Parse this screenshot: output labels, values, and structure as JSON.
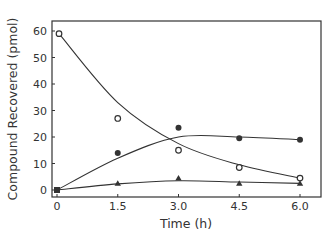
{
  "chart_data": {
    "type": "scatter",
    "title": "",
    "xlabel": "Time (h)",
    "ylabel": "Compound Recovered (pmol)",
    "x": [
      0,
      1.5,
      3.0,
      4.5,
      6.0
    ],
    "xticks": [
      "0",
      "1.5",
      "3.0",
      "4.5",
      "6.0"
    ],
    "yticks": [
      "0",
      "10",
      "20",
      "30",
      "40",
      "50",
      "60"
    ],
    "xlim": [
      -0.15,
      6.5
    ],
    "ylim": [
      -3,
      64
    ],
    "grid": false,
    "legend": null,
    "series": [
      {
        "name": "open circles",
        "marker": "open-circle",
        "values": [
          59,
          27,
          15,
          8.5,
          4.5
        ],
        "fit": "smooth decay curve"
      },
      {
        "name": "filled circles",
        "marker": "filled-circle",
        "values": [
          0,
          14,
          23.5,
          19.5,
          19
        ],
        "fit": "smooth rise then plateau curve"
      },
      {
        "name": "filled triangles",
        "marker": "filled-triangle",
        "values": [
          0,
          2.5,
          4.5,
          2.5,
          2.5
        ],
        "fit": "smooth low curve"
      }
    ]
  },
  "colors": {
    "ink": "#333333",
    "background": "#ffffff"
  }
}
